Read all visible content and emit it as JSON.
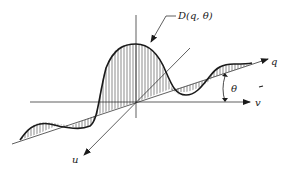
{
  "diagram": {
    "type": "3d-axes-curve-projection",
    "labels": {
      "function": "D(q, θ)",
      "q_axis": "q",
      "v_axis": "v",
      "u_axis": "u",
      "angle": "θ"
    },
    "colors": {
      "stroke": "#1a1a1a",
      "hatch": "#3a3a3a",
      "background": "#ffffff"
    }
  }
}
